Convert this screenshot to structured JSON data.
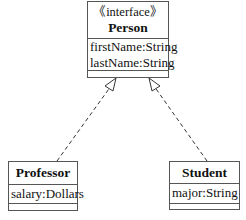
{
  "diagram": {
    "type": "UML class diagram",
    "classes": [
      {
        "id": "person",
        "stereotype": "《interface》",
        "name": "Person",
        "attributes": [
          "firstName:String",
          "lastName:String"
        ]
      },
      {
        "id": "professor",
        "name": "Professor",
        "attributes": [
          "salary:Dollars"
        ]
      },
      {
        "id": "student",
        "name": "Student",
        "attributes": [
          "major:String"
        ]
      }
    ],
    "relations": [
      {
        "from": "Professor",
        "to": "Person",
        "kind": "realization"
      },
      {
        "from": "Student",
        "to": "Person",
        "kind": "realization"
      }
    ]
  }
}
